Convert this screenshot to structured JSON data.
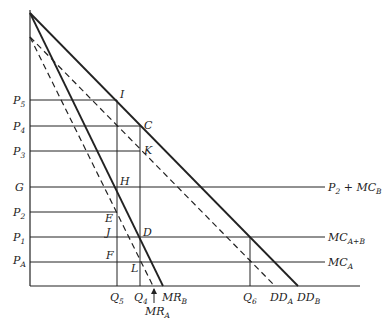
{
  "diagram": {
    "type": "economics-price-discrimination-diagram",
    "y_axis_labels": [
      {
        "id": "P5",
        "main": "P",
        "sub": "5",
        "y": 100
      },
      {
        "id": "P4",
        "main": "P",
        "sub": "4",
        "y": 126
      },
      {
        "id": "P3",
        "main": "P",
        "sub": "3",
        "y": 151
      },
      {
        "id": "G",
        "main": "G",
        "sub": "",
        "y": 187
      },
      {
        "id": "P2",
        "main": "P",
        "sub": "2",
        "y": 212
      },
      {
        "id": "P1",
        "main": "P",
        "sub": "1",
        "y": 237
      },
      {
        "id": "PA",
        "main": "P",
        "sub": "A",
        "y": 262
      }
    ],
    "x_axis_labels": [
      {
        "id": "Q5",
        "main": "Q",
        "sub": "5",
        "x": 117
      },
      {
        "id": "Q4",
        "main": "Q",
        "sub": "4",
        "x": 140
      },
      {
        "id": "MRB",
        "main": "MR",
        "sub": "B",
        "x": 163
      },
      {
        "id": "Q6",
        "main": "Q",
        "sub": "6",
        "x": 250
      },
      {
        "id": "DDA",
        "main": "DD",
        "sub": "A",
        "x": 275
      },
      {
        "id": "DDB",
        "main": "DD",
        "sub": "B",
        "x": 298
      }
    ],
    "mra_label": {
      "main": "MR",
      "sub": "A"
    },
    "point_labels": {
      "I": "I",
      "C": "C",
      "K": "K",
      "H": "H",
      "E": "E",
      "J": "J",
      "D": "D",
      "F": "F",
      "L": "L"
    },
    "curve_labels": {
      "p2_mcb": {
        "main1": "P",
        "sub1": "2",
        "rest": " + MC",
        "sub2": "B"
      },
      "mc_ab": {
        "main": "MC",
        "sub": "A+B"
      },
      "mc_a": {
        "main": "MC",
        "sub": "A"
      }
    },
    "curves": [
      {
        "name": "DD_B",
        "style": "solid",
        "from": [
          30,
          13
        ],
        "to": [
          298,
          286
        ]
      },
      {
        "name": "MR_B",
        "style": "solid",
        "from": [
          30,
          13
        ],
        "to": [
          163,
          286
        ]
      },
      {
        "name": "DD_A",
        "style": "dashed",
        "from": [
          30,
          37
        ],
        "to": [
          275,
          286
        ]
      },
      {
        "name": "MR_A",
        "style": "dashed",
        "from": [
          30,
          37
        ],
        "to": [
          153,
          286
        ]
      }
    ],
    "colors": {
      "line": "#222222",
      "background": "#ffffff"
    }
  }
}
